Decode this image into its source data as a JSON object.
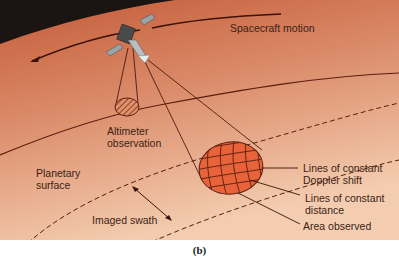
{
  "figure": {
    "caption": "(b)",
    "colors": {
      "space": "#1a1412",
      "surface_top": "#c9613e",
      "surface_bottom": "#f2c6a6",
      "line": "#5a1e10",
      "area_fill": "#e8623a",
      "solar_panel": "#9aa3a8"
    },
    "labels": {
      "spacecraft_motion": "Spacecraft motion",
      "altimeter_observation": "Altimeter\nobservation",
      "planetary_surface": "Planetary\nsurface",
      "imaged_swath": "Imaged swath",
      "lines_constant_doppler": "Lines of constant\nDoppler shift",
      "lines_constant_distance": "Lines of constant\ndistance",
      "area_observed": "Area observed"
    }
  }
}
